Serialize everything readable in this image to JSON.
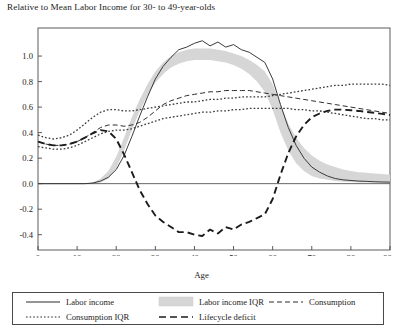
{
  "chart_data": {
    "type": "line",
    "title": "Relative to Mean Labor Income for 30- to 49-year-olds",
    "xlabel": "Age",
    "ylabel": "",
    "xlim": [
      0,
      90
    ],
    "ylim": [
      -0.52,
      1.22
    ],
    "grid": false,
    "legend_position": "bottom",
    "xticks": [
      0,
      10,
      20,
      30,
      40,
      50,
      60,
      70,
      80,
      90
    ],
    "xticklabels": [
      "0",
      "10",
      "20",
      "30",
      "40",
      "50",
      "60",
      "70",
      "80",
      "90+"
    ],
    "yticks": [
      1.0,
      0.8,
      0.6,
      0.4,
      0.2,
      0.0,
      -0.2,
      -0.4
    ],
    "yticklabels": [
      "1.0",
      "0.8",
      "0.6",
      "0.4",
      "0.2",
      "0.0",
      "-0.2",
      "-0.4"
    ],
    "zero_line": 0.0,
    "x": [
      0,
      2,
      4,
      6,
      8,
      10,
      12,
      14,
      16,
      18,
      20,
      22,
      24,
      26,
      28,
      30,
      32,
      34,
      36,
      38,
      40,
      42,
      44,
      46,
      48,
      50,
      52,
      54,
      56,
      58,
      60,
      62,
      64,
      66,
      68,
      70,
      72,
      74,
      76,
      78,
      80,
      82,
      84,
      86,
      88,
      90
    ],
    "series": [
      {
        "name": "Labor income",
        "style": "solid",
        "color": "#3a3a3a",
        "values": [
          0.0,
          0.0,
          0.0,
          0.0,
          0.0,
          0.0,
          0.0,
          0.005,
          0.02,
          0.05,
          0.11,
          0.22,
          0.37,
          0.53,
          0.68,
          0.82,
          0.92,
          0.99,
          1.05,
          1.07,
          1.1,
          1.12,
          1.08,
          1.11,
          1.07,
          1.09,
          1.05,
          1.03,
          0.99,
          0.95,
          0.82,
          0.62,
          0.44,
          0.3,
          0.2,
          0.13,
          0.09,
          0.06,
          0.04,
          0.03,
          0.025,
          0.02,
          0.018,
          0.015,
          0.013,
          0.012
        ]
      },
      {
        "name": "Labor income IQR upper",
        "style": "band-upper",
        "color": "#d6d6d6",
        "values": [
          0.0,
          0.0,
          0.0,
          0.0,
          0.0,
          0.0,
          0.0,
          0.01,
          0.04,
          0.1,
          0.21,
          0.36,
          0.52,
          0.66,
          0.78,
          0.88,
          0.95,
          1.0,
          1.03,
          1.05,
          1.06,
          1.06,
          1.06,
          1.05,
          1.04,
          1.02,
          1.0,
          0.97,
          0.93,
          0.88,
          0.78,
          0.62,
          0.47,
          0.36,
          0.28,
          0.22,
          0.18,
          0.15,
          0.13,
          0.11,
          0.1,
          0.09,
          0.085,
          0.08,
          0.075,
          0.07
        ]
      },
      {
        "name": "Labor income IQR lower",
        "style": "band-lower",
        "color": "#d6d6d6",
        "values": [
          0.0,
          0.0,
          0.0,
          0.0,
          0.0,
          0.0,
          0.0,
          0.0,
          0.01,
          0.04,
          0.12,
          0.26,
          0.42,
          0.57,
          0.69,
          0.79,
          0.86,
          0.91,
          0.94,
          0.96,
          0.97,
          0.97,
          0.97,
          0.96,
          0.95,
          0.93,
          0.9,
          0.86,
          0.8,
          0.72,
          0.58,
          0.4,
          0.26,
          0.16,
          0.1,
          0.06,
          0.04,
          0.03,
          0.02,
          0.015,
          0.012,
          0.01,
          0.01,
          0.008,
          0.008,
          0.007
        ]
      },
      {
        "name": "Consumption",
        "style": "dashed",
        "color": "#2e2e2e",
        "values": [
          0.33,
          0.31,
          0.3,
          0.3,
          0.31,
          0.33,
          0.36,
          0.4,
          0.44,
          0.46,
          0.46,
          0.45,
          0.46,
          0.48,
          0.52,
          0.57,
          0.62,
          0.65,
          0.67,
          0.69,
          0.7,
          0.71,
          0.72,
          0.72,
          0.73,
          0.73,
          0.73,
          0.73,
          0.72,
          0.71,
          0.7,
          0.69,
          0.68,
          0.67,
          0.66,
          0.65,
          0.64,
          0.63,
          0.62,
          0.61,
          0.6,
          0.59,
          0.58,
          0.57,
          0.56,
          0.55
        ]
      },
      {
        "name": "Consumption IQR upper",
        "style": "dotted",
        "color": "#3a3a3a",
        "values": [
          0.38,
          0.36,
          0.35,
          0.36,
          0.38,
          0.42,
          0.47,
          0.52,
          0.56,
          0.58,
          0.58,
          0.57,
          0.57,
          0.58,
          0.59,
          0.6,
          0.61,
          0.62,
          0.63,
          0.64,
          0.64,
          0.65,
          0.66,
          0.66,
          0.67,
          0.67,
          0.68,
          0.68,
          0.68,
          0.68,
          0.69,
          0.7,
          0.71,
          0.72,
          0.73,
          0.74,
          0.75,
          0.76,
          0.77,
          0.77,
          0.78,
          0.78,
          0.78,
          0.78,
          0.78,
          0.77
        ]
      },
      {
        "name": "Consumption IQR lower",
        "style": "dotted",
        "color": "#3a3a3a",
        "values": [
          0.29,
          0.28,
          0.27,
          0.27,
          0.28,
          0.3,
          0.33,
          0.36,
          0.39,
          0.41,
          0.42,
          0.42,
          0.43,
          0.45,
          0.47,
          0.49,
          0.51,
          0.52,
          0.53,
          0.54,
          0.55,
          0.56,
          0.56,
          0.57,
          0.57,
          0.58,
          0.58,
          0.59,
          0.59,
          0.59,
          0.59,
          0.59,
          0.59,
          0.58,
          0.58,
          0.57,
          0.57,
          0.56,
          0.55,
          0.54,
          0.53,
          0.52,
          0.51,
          0.51,
          0.5,
          0.5
        ]
      },
      {
        "name": "Lifecycle deficit",
        "style": "longdash",
        "color": "#1c1c1c",
        "values": [
          0.33,
          0.31,
          0.3,
          0.3,
          0.31,
          0.33,
          0.36,
          0.395,
          0.42,
          0.41,
          0.35,
          0.23,
          0.09,
          -0.05,
          -0.16,
          -0.25,
          -0.3,
          -0.34,
          -0.38,
          -0.38,
          -0.4,
          -0.41,
          -0.36,
          -0.39,
          -0.34,
          -0.36,
          -0.32,
          -0.3,
          -0.27,
          -0.24,
          -0.12,
          0.07,
          0.24,
          0.37,
          0.46,
          0.52,
          0.55,
          0.57,
          0.58,
          0.58,
          0.575,
          0.57,
          0.562,
          0.555,
          0.547,
          0.538
        ]
      }
    ],
    "legend": [
      {
        "label": "Labor income",
        "style": "solid"
      },
      {
        "label": "Labor income IQR",
        "style": "band"
      },
      {
        "label": "Consumption",
        "style": "dashed"
      },
      {
        "label": "Consumption IQR",
        "style": "dotted"
      },
      {
        "label": "Lifecycle deficit",
        "style": "longdash"
      }
    ],
    "colors": {
      "axis": "#4a4a4a",
      "band": "#d6d6d6",
      "line": "#2b2b2b",
      "background": "#ffffff"
    }
  }
}
